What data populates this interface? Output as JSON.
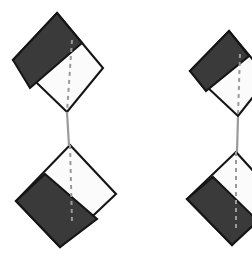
{
  "figure": {
    "canvas": {
      "width": 252,
      "height": 261,
      "background": "#ffffff"
    },
    "colors": {
      "panel_light": "#fbfbfb",
      "panel_dark": "#3a3a3a",
      "outline": "#151515",
      "fold_dash": "#9a9a9a",
      "connector": "#9a9a9a"
    },
    "shapes": [
      {
        "id": "top-left-diamond",
        "label": "Diamond 1",
        "position": "top-left",
        "dark_band_edge": "upper-left",
        "clipped": "false",
        "outline_points": "57,13 103,68 67,112 13,60",
        "band_points": "57,13 82,43 30,88 13,60",
        "fold_points": "72,40 67,112"
      },
      {
        "id": "top-right-diamond",
        "label": "Diamond 2",
        "position": "top-right",
        "dark_band_edge": "upper-left",
        "clipped": "true",
        "outline_points": "229,31 268,78 238,116 190,71",
        "band_points": "229,31 249,56 206,91 190,71",
        "fold_points": "240,54 238,116"
      },
      {
        "id": "bottom-left-diamond",
        "label": "Diamond 3",
        "position": "bottom-left",
        "dark_band_edge": "lower-left",
        "clipped": "false",
        "outline_points": "70,145 116,194 60,247 16,201",
        "band_points": "45,174 97,219 60,247 16,201",
        "fold_points": "70,145 72,222"
      },
      {
        "id": "bottom-right-diamond",
        "label": "Diamond 4",
        "position": "bottom-right",
        "dark_band_edge": "lower-left",
        "clipped": "true",
        "outline_points": "236,152 276,196 232,245 187,199",
        "band_points": "213,177 258,221 232,245 187,199",
        "fold_points": "236,152 236,228"
      }
    ],
    "connectors": [
      {
        "id": "left-connector",
        "label": "Vertical connector between left diamonds",
        "from_shape": "top-left-diamond",
        "to_shape": "bottom-left-diamond",
        "path": "M 67 112 L 69 146"
      },
      {
        "id": "right-connector",
        "label": "Vertical connector between right diamonds",
        "from_shape": "top-right-diamond",
        "to_shape": "bottom-right-diamond",
        "path": "M 238 117 L 237 152"
      }
    ]
  }
}
